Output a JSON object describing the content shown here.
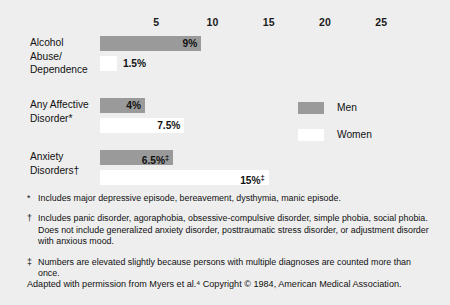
{
  "chart_data": {
    "type": "bar",
    "orientation": "horizontal",
    "title": "",
    "xlabel": "",
    "ylabel": "",
    "xlim": [
      0,
      27
    ],
    "grid": false,
    "legend_position": "right-middle",
    "axis_ticks": [
      {
        "label": "5",
        "value": 5
      },
      {
        "label": "10",
        "value": 10
      },
      {
        "label": "15",
        "value": 15
      },
      {
        "label": "20",
        "value": 20
      },
      {
        "label": "25",
        "value": 25
      }
    ],
    "categories": [
      "Alcohol Abuse/ Dependence",
      "Any Affective Disorder*",
      "Anxiety Disorders†"
    ],
    "series": [
      {
        "name": "Men",
        "values": [
          9,
          4,
          6.5
        ],
        "color": "#9a9a9a"
      },
      {
        "name": "Women",
        "values": [
          1.5,
          7.5,
          15
        ],
        "color": "#ffffff"
      }
    ],
    "groups": [
      {
        "label_lines": [
          "Alcohol",
          "Abuse/",
          "Dependence"
        ],
        "bars": [
          {
            "series": "Men",
            "value": 9,
            "value_label": "9%",
            "marker": "",
            "label_inside": true
          },
          {
            "series": "Women",
            "value": 1.5,
            "value_label": "1.5%",
            "marker": "",
            "label_inside": false
          }
        ]
      },
      {
        "label_lines": [
          "Any Affective",
          "Disorder*"
        ],
        "bars": [
          {
            "series": "Men",
            "value": 4,
            "value_label": "4%",
            "marker": "",
            "label_inside": true
          },
          {
            "series": "Women",
            "value": 7.5,
            "value_label": "7.5%",
            "marker": "",
            "label_inside": true
          }
        ]
      },
      {
        "label_lines": [
          "Anxiety",
          "Disorders†"
        ],
        "bars": [
          {
            "series": "Men",
            "value": 6.5,
            "value_label": "6.5%",
            "marker": "‡",
            "label_inside": true
          },
          {
            "series": "Women",
            "value": 15,
            "value_label": "15%",
            "marker": "‡",
            "label_inside": true
          }
        ]
      }
    ]
  },
  "legend": {
    "items": [
      {
        "label": "Men",
        "color": "#9a9a9a"
      },
      {
        "label": "Women",
        "color": "#ffffff"
      }
    ]
  },
  "footnotes": [
    {
      "marker": "*",
      "text": "Includes major depressive episode, bereavement, dysthymia, manic episode."
    },
    {
      "marker": "†",
      "text": "Includes panic disorder, agoraphobia, obsessive-compulsive disorder, simple phobia, social phobia. Does not include generalized anxiety disorder, posttraumatic stress disorder, or adjustment disorder with anxious mood."
    },
    {
      "marker": "‡",
      "text": "Numbers are elevated slightly because persons with multiple diagnoses are counted more than once."
    }
  ],
  "source_note": "Adapted with permission from Myers et al.⁴ Copyright © 1984, American Medical Association.",
  "colors": {
    "background": "#eeeeee",
    "men_bar": "#9a9a9a",
    "women_bar": "#ffffff",
    "text": "#111111"
  }
}
